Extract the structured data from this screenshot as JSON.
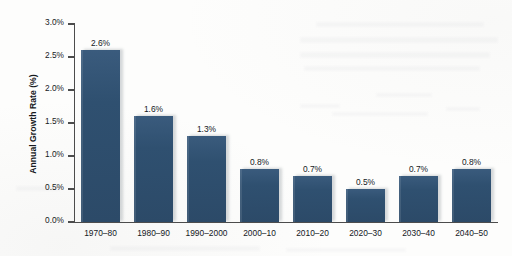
{
  "chart_data": {
    "type": "bar",
    "title": "",
    "xlabel": "",
    "ylabel": "Annual Growth Rate (%)",
    "categories": [
      "1970–80",
      "1980–90",
      "1990–2000",
      "2000–10",
      "2010–20",
      "2020–30",
      "2030–40",
      "2040–50"
    ],
    "values": [
      2.6,
      1.6,
      1.3,
      0.8,
      0.7,
      0.5,
      0.7,
      0.8
    ],
    "value_labels": [
      "2.6%",
      "1.6%",
      "1.3%",
      "0.8%",
      "0.7%",
      "0.5%",
      "0.7%",
      "0.8%"
    ],
    "ylim": [
      0.0,
      3.0
    ],
    "ytick_values": [
      0.0,
      0.5,
      1.0,
      1.5,
      2.0,
      2.5,
      3.0
    ],
    "ytick_labels": [
      "0.0%",
      "0.5%",
      "1.0%",
      "1.5%",
      "2.0%",
      "2.5%",
      "3.0%"
    ],
    "grid": false,
    "legend": false,
    "bar_color": "#2f5070",
    "axis_color": "#4c4c4c",
    "text_color": "#14181c",
    "background_color": "#fdfdfc"
  },
  "axes": {
    "y_title": "Annual Growth Rate (%)"
  }
}
